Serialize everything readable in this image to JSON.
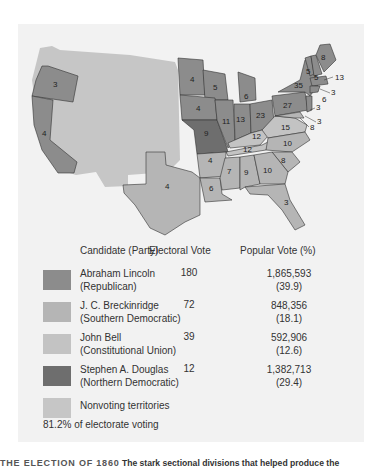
{
  "colors": {
    "lincoln": "#8c8c8c",
    "breckinridge": "#b5b5b5",
    "bell": "#c3c3c3",
    "douglas": "#6e6e6e",
    "territories": "#c6c6c6",
    "panel": "#f2f2f2"
  },
  "map": {
    "state_labels": [
      {
        "ev": "3",
        "state": "Oregon",
        "winner": "lincoln"
      },
      {
        "ev": "4",
        "state": "California",
        "winner": "lincoln"
      },
      {
        "ev": "4",
        "state": "Minnesota",
        "winner": "lincoln"
      },
      {
        "ev": "5",
        "state": "Wisconsin",
        "winner": "lincoln"
      },
      {
        "ev": "4",
        "state": "Iowa",
        "winner": "lincoln"
      },
      {
        "ev": "6",
        "state": "Michigan",
        "winner": "lincoln"
      },
      {
        "ev": "11",
        "state": "Illinois",
        "winner": "lincoln"
      },
      {
        "ev": "13",
        "state": "Indiana",
        "winner": "lincoln"
      },
      {
        "ev": "23",
        "state": "Ohio",
        "winner": "lincoln"
      },
      {
        "ev": "27",
        "state": "Pennsylvania",
        "winner": "lincoln"
      },
      {
        "ev": "35",
        "state": "New York",
        "winner": "lincoln"
      },
      {
        "ev": "8",
        "state": "Maine",
        "winner": "lincoln"
      },
      {
        "ev": "5",
        "state": "Vermont",
        "winner": "lincoln"
      },
      {
        "ev": "5",
        "state": "New Hampshire",
        "winner": "lincoln"
      },
      {
        "ev": "13",
        "state": "Massachusetts",
        "winner": "lincoln"
      },
      {
        "ev": "4",
        "state": "Rhode Island",
        "winner": "lincoln"
      },
      {
        "ev": "6",
        "state": "Connecticut",
        "winner": "lincoln"
      },
      {
        "ev": "3",
        "state": "New Jersey",
        "winner": "split"
      },
      {
        "ev": "9",
        "state": "Missouri",
        "winner": "douglas"
      },
      {
        "ev": "12",
        "state": "Kentucky",
        "winner": "bell"
      },
      {
        "ev": "15",
        "state": "Virginia",
        "winner": "bell"
      },
      {
        "ev": "12",
        "state": "Tennessee",
        "winner": "bell"
      },
      {
        "ev": "3",
        "state": "Delaware",
        "winner": "breckinridge"
      },
      {
        "ev": "8",
        "state": "Maryland",
        "winner": "breckinridge"
      },
      {
        "ev": "10",
        "state": "North Carolina",
        "winner": "breckinridge"
      },
      {
        "ev": "8",
        "state": "South Carolina",
        "winner": "breckinridge"
      },
      {
        "ev": "4",
        "state": "Arkansas",
        "winner": "breckinridge"
      },
      {
        "ev": "7",
        "state": "Mississippi",
        "winner": "breckinridge"
      },
      {
        "ev": "9",
        "state": "Alabama",
        "winner": "breckinridge"
      },
      {
        "ev": "10",
        "state": "Georgia",
        "winner": "breckinridge"
      },
      {
        "ev": "6",
        "state": "Louisiana",
        "winner": "breckinridge"
      },
      {
        "ev": "3",
        "state": "Florida",
        "winner": "breckinridge"
      },
      {
        "ev": "4",
        "state": "Texas",
        "winner": "breckinridge"
      }
    ]
  },
  "legend": {
    "headers": {
      "candidate": "Candidate (Party)",
      "electoral": "Electoral Vote",
      "popular": "Popular Vote (%)"
    },
    "rows": [
      {
        "name": "Abraham Lincoln",
        "party": "(Republican)",
        "electoral": "180",
        "popular": "1,865,593",
        "pct": "(39.9)",
        "swatch": "lincoln"
      },
      {
        "name": "J. C. Breckinridge",
        "party": "(Southern Democratic)",
        "electoral": "72",
        "popular": "848,356",
        "pct": "(18.1)",
        "swatch": "breckinridge"
      },
      {
        "name": "John Bell",
        "party": "(Constitutional Union)",
        "electoral": "39",
        "popular": "592,906",
        "pct": "(12.6)",
        "swatch": "bell"
      },
      {
        "name": "Stephen A. Douglas",
        "party": "(Northern Democratic)",
        "electoral": "12",
        "popular": "1,382,713",
        "pct": "(29.4)",
        "swatch": "douglas"
      },
      {
        "name": "Nonvoting territories",
        "party": "",
        "electoral": "",
        "popular": "",
        "pct": "",
        "swatch": "territories"
      }
    ],
    "turnout": "81.2% of electorate voting"
  },
  "caption": {
    "title": "THE ELECTION OF 1860",
    "text": "The stark sectional divisions that helped produce the"
  }
}
